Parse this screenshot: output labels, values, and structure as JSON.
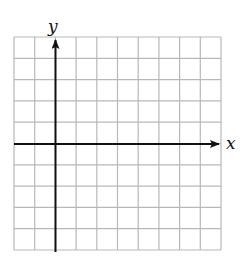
{
  "diagram": {
    "type": "coordinate-grid",
    "grid": {
      "columns": 10,
      "rows": 10,
      "line_color": "#b8b8b8"
    },
    "axes": {
      "x_label": "x",
      "y_label": "y",
      "color": "#111111",
      "y_axis_column_index": 2,
      "x_axis_row_index": 5
    }
  }
}
